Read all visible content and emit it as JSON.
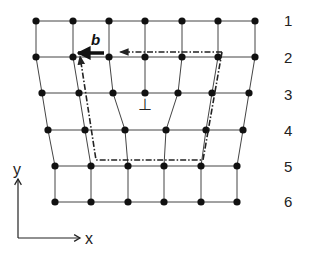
{
  "diagram": {
    "type": "edge-dislocation-burgers-circuit",
    "burgers_vector_label": "b",
    "row_labels": [
      "1",
      "2",
      "3",
      "4",
      "5",
      "6"
    ],
    "axes": {
      "x_label": "x",
      "y_label": "y"
    },
    "dislocation_symbol": "⊥",
    "colors": {
      "line": "#333333",
      "node": "#111111",
      "circuit": "#222222",
      "burgers": "#111111"
    },
    "rows": [
      {
        "y": 21,
        "xs": [
          36,
          73,
          109,
          145,
          182,
          218,
          255
        ]
      },
      {
        "y": 57,
        "xs": [
          36,
          73,
          109,
          145,
          182,
          218,
          255
        ]
      },
      {
        "y": 93,
        "xs": [
          42,
          79,
          113,
          145,
          178,
          212,
          249
        ]
      },
      {
        "y": 130,
        "xs": [
          48,
          85,
          125,
          166,
          206,
          243
        ]
      },
      {
        "y": 166,
        "xs": [
          55,
          91,
          128,
          164,
          201,
          237
        ]
      },
      {
        "y": 202,
        "xs": [
          55,
          91,
          128,
          164,
          201,
          237
        ]
      }
    ],
    "vertical_links": [
      [
        0,
        0,
        1,
        0
      ],
      [
        0,
        1,
        1,
        1
      ],
      [
        0,
        2,
        1,
        2
      ],
      [
        0,
        3,
        1,
        3
      ],
      [
        0,
        4,
        1,
        4
      ],
      [
        0,
        5,
        1,
        5
      ],
      [
        0,
        6,
        1,
        6
      ],
      [
        1,
        0,
        2,
        0
      ],
      [
        1,
        1,
        2,
        1
      ],
      [
        1,
        2,
        2,
        2
      ],
      [
        1,
        3,
        2,
        3
      ],
      [
        1,
        4,
        2,
        4
      ],
      [
        1,
        5,
        2,
        5
      ],
      [
        1,
        6,
        2,
        6
      ],
      [
        2,
        0,
        3,
        0
      ],
      [
        2,
        1,
        3,
        1
      ],
      [
        2,
        2,
        3,
        2
      ],
      [
        2,
        4,
        3,
        3
      ],
      [
        2,
        5,
        3,
        4
      ],
      [
        2,
        6,
        3,
        5
      ],
      [
        3,
        0,
        4,
        0
      ],
      [
        3,
        1,
        4,
        1
      ],
      [
        3,
        2,
        4,
        2
      ],
      [
        3,
        3,
        4,
        3
      ],
      [
        3,
        4,
        4,
        4
      ],
      [
        3,
        5,
        4,
        5
      ],
      [
        4,
        0,
        5,
        0
      ],
      [
        4,
        1,
        5,
        1
      ],
      [
        4,
        2,
        5,
        2
      ],
      [
        4,
        3,
        5,
        3
      ],
      [
        4,
        4,
        5,
        4
      ],
      [
        4,
        5,
        5,
        5
      ]
    ],
    "circuit": {
      "path": [
        [
          222,
          52
        ],
        [
          203,
          160
        ],
        [
          96,
          160
        ],
        [
          80,
          56
        ]
      ],
      "top_segment": [
        [
          222,
          52
        ],
        [
          100,
          52
        ]
      ]
    },
    "burgers_arrow": {
      "from": [
        104,
        53
      ],
      "to": [
        78,
        53
      ]
    },
    "dislocation_position": [
      145,
      106
    ],
    "row_label_x": 288
  }
}
